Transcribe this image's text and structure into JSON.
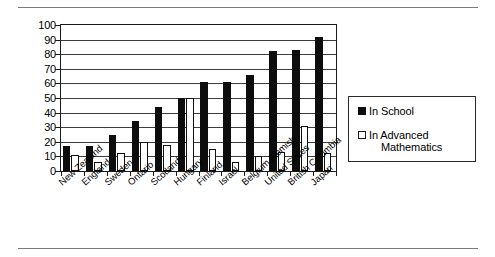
{
  "page": {
    "rules": [
      "top-rule",
      "bottom-rule"
    ]
  },
  "legend": {
    "position": "right",
    "items": [
      {
        "label": "In School",
        "swatch": "filled-black-square",
        "color": "#0d0d0d"
      },
      {
        "label": "In Advanced",
        "label2": "Mathematics",
        "full": "In Advanced Mathematics",
        "swatch": "hollow-white-square",
        "color": "#ffffff"
      }
    ]
  },
  "chart_data": {
    "type": "bar",
    "title": "",
    "subtitle": "",
    "xlabel": "",
    "ylabel": "",
    "ylim": [
      0,
      100
    ],
    "yticks": [
      0,
      10,
      20,
      30,
      40,
      50,
      60,
      70,
      80,
      90,
      100
    ],
    "grid": true,
    "legend_position": "right",
    "categories": [
      "New Zealand",
      "England",
      "Sweden",
      "Ontario",
      "Scotland",
      "Hungary",
      "Finland",
      "Israel",
      "Belgium Flemish",
      "United States",
      "British Columbia",
      "Japan"
    ],
    "series": [
      {
        "name": "In School",
        "color": "#0d0d0d",
        "values": [
          17,
          17,
          25,
          34,
          44,
          50,
          61,
          61,
          66,
          82,
          83,
          92
        ]
      },
      {
        "name": "In Advanced Mathematics",
        "color": "#ffffff",
        "values": [
          11,
          6,
          12,
          20,
          18,
          50,
          15,
          6,
          10,
          13,
          31,
          12
        ]
      }
    ]
  }
}
